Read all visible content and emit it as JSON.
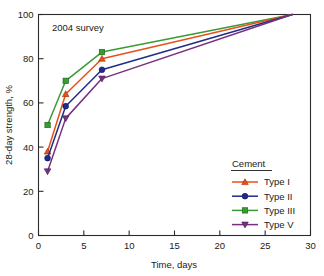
{
  "chart_data": {
    "type": "line",
    "title": "",
    "annotation": "2004 survey",
    "xlabel": "Time, days",
    "ylabel": "28-day strength, %",
    "xlim": [
      0,
      30
    ],
    "ylim": [
      0,
      100
    ],
    "xticks": [
      "0",
      "5",
      "10",
      "15",
      "20",
      "25",
      "30"
    ],
    "xtick_values": [
      0,
      5,
      10,
      15,
      20,
      25,
      30
    ],
    "yticks": [
      "0",
      "20",
      "40",
      "60",
      "80",
      "100"
    ],
    "ytick_values": [
      0,
      20,
      40,
      60,
      80,
      100
    ],
    "grid": false,
    "legend_position": "lower-right",
    "legend_title": "Cement",
    "x": [
      1,
      3,
      7,
      28
    ],
    "series": [
      {
        "name": "Type I",
        "color": "#E8501A",
        "marker": "triangle-up",
        "values": [
          38,
          64,
          80,
          100
        ]
      },
      {
        "name": "Type II",
        "color": "#1F2D87",
        "marker": "circle",
        "values": [
          35,
          58.5,
          75,
          100
        ]
      },
      {
        "name": "Type III",
        "color": "#3A9B35",
        "marker": "square",
        "values": [
          50,
          70,
          83,
          100
        ]
      },
      {
        "name": "Type V",
        "color": "#77307F",
        "marker": "triangle-down",
        "values": [
          29,
          53,
          71,
          100
        ]
      }
    ]
  },
  "axes": {
    "x_title": "Time, days",
    "y_title": "28-day strength, %"
  },
  "legend": {
    "title": "Cement",
    "entries": [
      {
        "label": "Type I"
      },
      {
        "label": "Type II"
      },
      {
        "label": "Type III"
      },
      {
        "label": "Type V"
      }
    ]
  },
  "annotations": {
    "survey_note": "2004 survey"
  }
}
